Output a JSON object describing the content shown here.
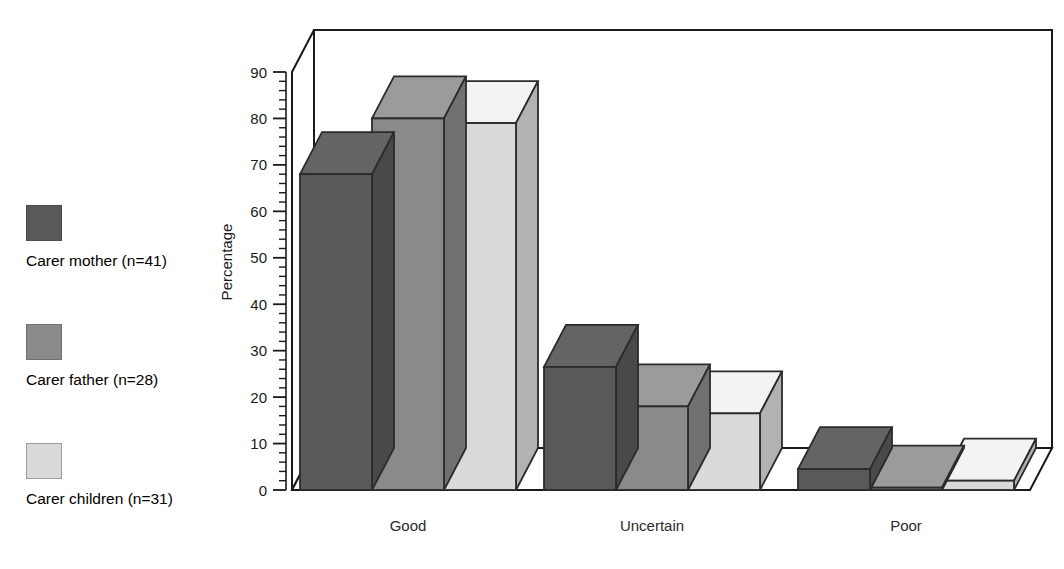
{
  "chart_data": {
    "type": "bar",
    "title": "",
    "subtitle": "",
    "xlabel": "",
    "ylabel": "Percentage",
    "categories": [
      "Good",
      "Uncertain",
      "Poor"
    ],
    "series": [
      {
        "name": "Carer mother (n=41)",
        "color": "#595959",
        "values": [
          68,
          26.5,
          4.5
        ]
      },
      {
        "name": "Carer father (n=28)",
        "color": "#8a8a8a",
        "values": [
          80,
          18,
          0.5
        ]
      },
      {
        "name": "Carer children (n=31)",
        "color": "#d9d9d9",
        "values": [
          79,
          16.5,
          2
        ]
      }
    ],
    "ylim": [
      0,
      90
    ],
    "ytick_step": 10,
    "yticks": [
      0,
      10,
      20,
      30,
      40,
      50,
      60,
      70,
      80,
      90
    ],
    "ytick_labels": [
      "0",
      "10",
      "20",
      "30",
      "40",
      "50",
      "60",
      "70",
      "80",
      "90"
    ],
    "minor_ticks_per_major": 5,
    "grid": true,
    "grid_axis": "y",
    "legend_position": "left-outside",
    "projection": "3d",
    "background_color": "#ffffff",
    "axis_color": "#1a1a1a",
    "grid_color": "#9a9a9a"
  },
  "legend": {
    "items": [
      {
        "label": "Carer mother (n=41)",
        "color": "#595959"
      },
      {
        "label": "Carer father (n=28)",
        "color": "#8a8a8a"
      },
      {
        "label": "Carer children (n=31)",
        "color": "#d9d9d9"
      }
    ]
  },
  "yaxis": {
    "title": "Percentage",
    "labels": [
      "90",
      "80",
      "70",
      "60",
      "50",
      "40",
      "30",
      "20",
      "10",
      "0"
    ]
  },
  "xaxis": {
    "labels": [
      "Good",
      "Uncertain",
      "Poor"
    ]
  }
}
